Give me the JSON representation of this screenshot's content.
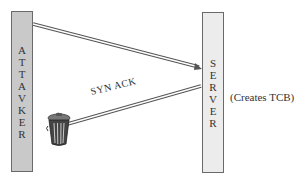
{
  "diagram": {
    "attacker": {
      "label": "ATTAVKER",
      "letters": [
        "A",
        "T",
        "T",
        "A",
        "V",
        "K",
        "E",
        "R"
      ],
      "fill": "#c9c9c9"
    },
    "server": {
      "label": "SERVER",
      "letters": [
        "S",
        "E",
        "R",
        "V",
        "E",
        "R"
      ],
      "fill": "#ececec"
    },
    "server_note": "(Creates TCB)",
    "arrows": [
      {
        "name": "syn",
        "from": "attacker",
        "to": "server",
        "label": ""
      },
      {
        "name": "synack",
        "from": "server",
        "to": "trash",
        "label": "SYN ACK"
      }
    ],
    "synack_label": "SYN ACK",
    "icons": {
      "trash": "trash-can-icon"
    }
  }
}
